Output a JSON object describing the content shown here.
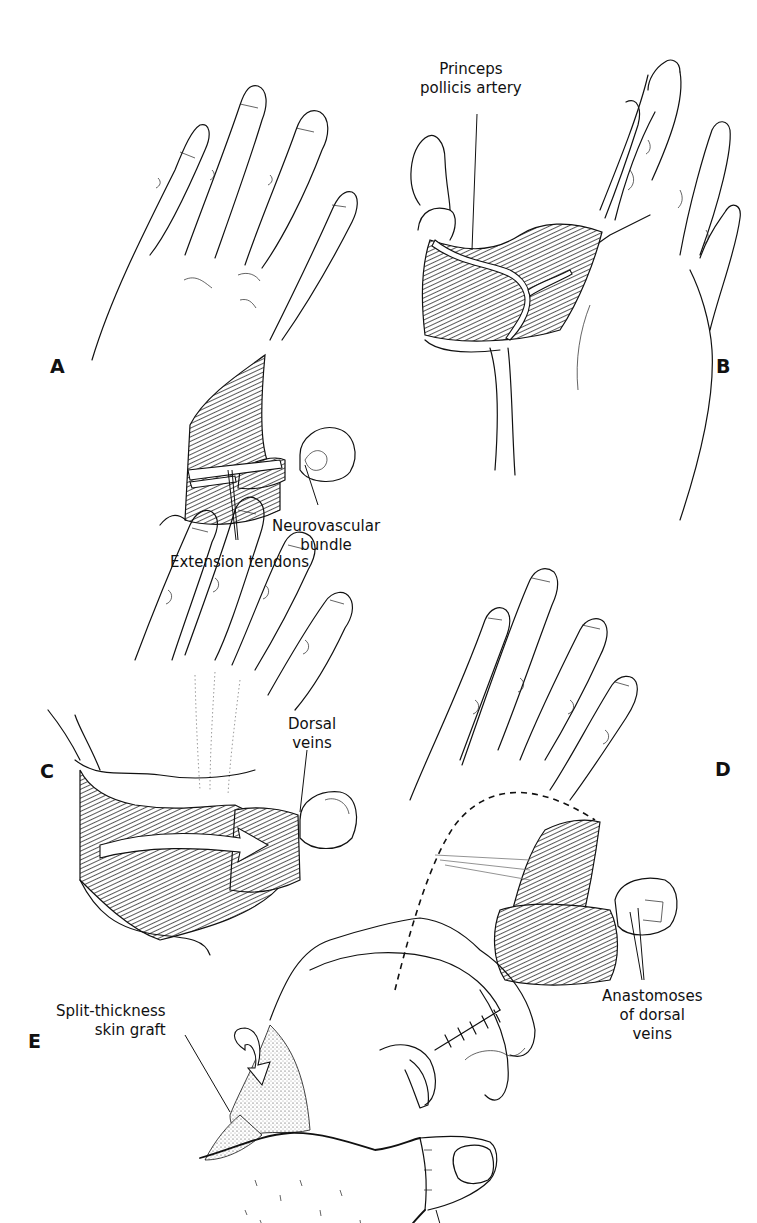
{
  "figure": {
    "panels": [
      {
        "id": "A",
        "letter": "A",
        "labels": {
          "neurovascular_bundle": [
            "Neurovascular",
            "bundle"
          ],
          "extension_tendons": "Extension tendons"
        }
      },
      {
        "id": "B",
        "letter": "B",
        "labels": {
          "princeps_pollicis_artery": [
            "Princeps",
            "pollicis artery"
          ]
        }
      },
      {
        "id": "C",
        "letter": "C",
        "labels": {
          "dorsal_veins": [
            "Dorsal",
            "veins"
          ]
        }
      },
      {
        "id": "D",
        "letter": "D",
        "labels": {
          "anastomoses": [
            "Anastomoses",
            "of dorsal",
            "veins"
          ]
        }
      },
      {
        "id": "E",
        "letter": "E",
        "labels": {
          "split_thickness_graft": [
            "Split-thickness",
            "skin graft"
          ],
          "completed_resection": [
            "Completed",
            "resection"
          ]
        }
      }
    ],
    "colors": {
      "ink": "#111111",
      "background": "#ffffff"
    }
  }
}
